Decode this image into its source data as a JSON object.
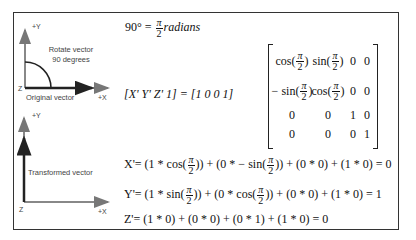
{
  "diagram": {
    "top_panel": {
      "y_axis_label": "+Y",
      "x_axis_label": "+X",
      "z_label": "Z",
      "rotate_label_line1": "Rotate vector",
      "rotate_label_line2": "90 degrees",
      "vector_label": "Original vector"
    },
    "bottom_panel": {
      "y_axis_label": "+Y",
      "x_axis_label": "+X",
      "z_label": "Z",
      "vector_label": "Transformed vector"
    }
  },
  "equations": {
    "angle": {
      "lhs": "90° =",
      "num": "π",
      "den": "2",
      "rhs": "radians"
    },
    "row_vector": "[X'   Y'   Z'   1] = [1   0   0   1]",
    "matrix": {
      "pi": "π",
      "two": "2",
      "rows": [
        [
          "cos",
          "sin",
          "0",
          "0"
        ],
        [
          "− sin",
          "cos",
          "0",
          "0"
        ],
        [
          "0",
          "0",
          "1",
          "0"
        ],
        [
          "0",
          "0",
          "0",
          "1"
        ]
      ]
    },
    "x_prime": {
      "lhs": "X'= (1 * cos(",
      "mid1": ")) + (0 * − sin(",
      "tail": ")) + (0 * 0) + (1 * 0) = 0"
    },
    "y_prime": {
      "lhs": "Y'= (1 * sin(",
      "mid1": ")) + (0 * cos(",
      "tail": ")) + (0 * 0) + (1 * 0) = 1"
    },
    "z_prime": "Z'= (1 * 0) + (0 * 0) + (0 * 1) + (1 * 0) = 0"
  }
}
